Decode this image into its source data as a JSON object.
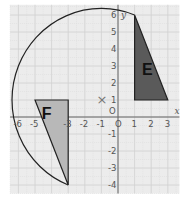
{
  "diagram": {
    "type": "coordinate-grid-rotation",
    "grid": {
      "xmin": -6.5,
      "xmax": 3.7,
      "ymin": -4.5,
      "ymax": 6.6,
      "background": "#ececec",
      "major_line": "#d0d0d0",
      "minor_line": "#dddddd"
    },
    "axes": {
      "x_label": "x",
      "y_label": "y",
      "origin_label": "O",
      "x_ticks": [
        "-6",
        "-5",
        "-4",
        "-3",
        "-2",
        "-1",
        "O",
        "1",
        "2",
        "3"
      ],
      "y_ticks": [
        "6",
        "5",
        "4",
        "3",
        "2",
        "1",
        "O",
        "-1",
        "-2",
        "-3",
        "-4"
      ]
    },
    "shapes": [
      {
        "name": "E",
        "label": "E",
        "fill": "#5a5a5a",
        "points": [
          [
            1,
            6
          ],
          [
            1,
            1
          ],
          [
            3,
            1
          ]
        ]
      },
      {
        "name": "F",
        "label": "F",
        "fill": "#b8b8b8",
        "points": [
          [
            -5,
            1
          ],
          [
            -3,
            1
          ],
          [
            -3,
            -4
          ]
        ]
      }
    ],
    "center_of_rotation": {
      "marker": "×",
      "x": -1,
      "y": 1
    },
    "arc": {
      "from": [
        1,
        6
      ],
      "to": [
        -3,
        -4
      ],
      "center": [
        -1,
        1
      ],
      "stroke": "#222222"
    }
  }
}
